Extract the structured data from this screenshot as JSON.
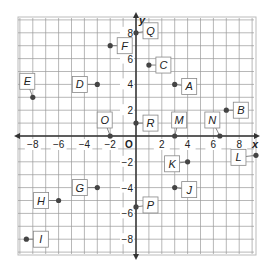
{
  "diagram": {
    "type": "coordinate-plane",
    "x_axis_label": "x",
    "y_axis_label": "y",
    "origin_label": "O",
    "x_ticks": [
      -8,
      -6,
      -4,
      -2,
      2,
      4,
      6,
      8
    ],
    "y_ticks": [
      -8,
      -6,
      -4,
      -2,
      2,
      4,
      6,
      8
    ],
    "grid_range": [
      -9,
      9
    ],
    "colors": {
      "grid": "#9a9a9a",
      "axis": "#333333",
      "point": "#444444",
      "label_box": "#ffffff"
    },
    "points": [
      {
        "name": "Q",
        "x": 0,
        "y": 8,
        "label_dx": 14,
        "label_dy": -2
      },
      {
        "name": "F",
        "x": -2,
        "y": 7,
        "label_dx": 14,
        "label_dy": 0
      },
      {
        "name": "C",
        "x": 1,
        "y": 5.5,
        "label_dx": 14,
        "label_dy": 0
      },
      {
        "name": "D",
        "x": -3,
        "y": 4,
        "label_dx": -18,
        "label_dy": 0
      },
      {
        "name": "A",
        "x": 3,
        "y": 4,
        "label_dx": 14,
        "label_dy": 2
      },
      {
        "name": "E",
        "x": -8,
        "y": 3,
        "label_dx": -6,
        "label_dy": -16
      },
      {
        "name": "B",
        "x": 7,
        "y": 2,
        "label_dx": 14,
        "label_dy": 0
      },
      {
        "name": "R",
        "x": 0,
        "y": 1,
        "label_dx": 14,
        "label_dy": 0
      },
      {
        "name": "O",
        "x": -2,
        "y": 0,
        "label_dx": -6,
        "label_dy": -16
      },
      {
        "name": "M",
        "x": 3,
        "y": 0,
        "label_dx": 4,
        "label_dy": -16
      },
      {
        "name": "N",
        "x": 6.5,
        "y": 0,
        "label_dx": -8,
        "label_dy": -16
      },
      {
        "name": "L",
        "x": 9.3,
        "y": -1.5,
        "label_dx": -18,
        "label_dy": 2
      },
      {
        "name": "K",
        "x": 4,
        "y": -2,
        "label_dx": -16,
        "label_dy": 2
      },
      {
        "name": "J",
        "x": 3,
        "y": -4,
        "label_dx": 14,
        "label_dy": 2
      },
      {
        "name": "G",
        "x": -3,
        "y": -4,
        "label_dx": -18,
        "label_dy": 0
      },
      {
        "name": "H",
        "x": -6,
        "y": -5,
        "label_dx": -18,
        "label_dy": 0
      },
      {
        "name": "P",
        "x": 0,
        "y": -5.5,
        "label_dx": 14,
        "label_dy": -2
      },
      {
        "name": "I",
        "x": -8.5,
        "y": -8,
        "label_dx": 14,
        "label_dy": 0
      }
    ]
  }
}
